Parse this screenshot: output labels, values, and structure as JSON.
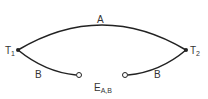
{
  "diagram": {
    "type": "thermocouple-circuit",
    "conductor_a_label": "A",
    "conductor_b_left_label": "B",
    "conductor_b_right_label": "B",
    "junction_1": {
      "label": "T",
      "subscript": "1"
    },
    "junction_2": {
      "label": "T",
      "subscript": "2"
    },
    "emf": {
      "label": "E",
      "subscript": "A,B"
    },
    "line_color": "#222222"
  }
}
